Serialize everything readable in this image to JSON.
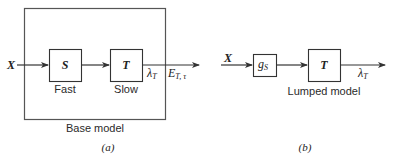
{
  "panel_a": {
    "input_label": "X",
    "block_s": {
      "label": "S",
      "caption": "Fast"
    },
    "block_t": {
      "label": "T",
      "caption": "Slow"
    },
    "output_lambda": {
      "symbol": "λ",
      "subscript": "T"
    },
    "output_e": {
      "symbol": "E",
      "subscript": "T, τ"
    },
    "enclosure_caption": "Base model",
    "panel_label": "(a)"
  },
  "panel_b": {
    "input_label": "X",
    "block_g": {
      "symbol": "g",
      "subscript": "S"
    },
    "block_t": {
      "label": "T"
    },
    "block_caption": "Lumped model",
    "output_lambda": {
      "symbol": "λ",
      "subscript": "T"
    },
    "panel_label": "(b)"
  },
  "colors": {
    "line": "#333333",
    "background": "#ffffff"
  }
}
